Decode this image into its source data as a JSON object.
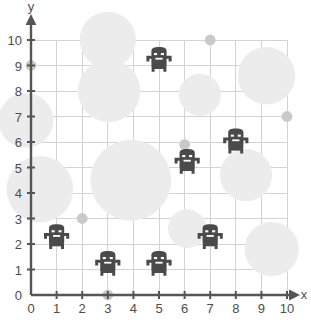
{
  "chart_data": {
    "type": "scatter",
    "title": "",
    "xlabel": "x",
    "ylabel": "y",
    "xlim": [
      0,
      10
    ],
    "ylim": [
      0,
      10
    ],
    "xticks": [
      "0",
      "1",
      "2",
      "3",
      "4",
      "5",
      "6",
      "7",
      "8",
      "9",
      "10"
    ],
    "yticks": [
      "0",
      "1",
      "2",
      "3",
      "4",
      "5",
      "6",
      "7",
      "8",
      "9",
      "10"
    ],
    "grid": true,
    "legend": "none",
    "colors": {
      "background": "#ffffff",
      "grid_line": "#d0d0d0",
      "axis_line": "#555555",
      "tick_text": "#4d4d4d",
      "bubble_fill": "#ececec",
      "dot_fill": "#c9c9c9",
      "robot_fill": "#4a4a4a"
    },
    "series": [
      {
        "name": "robots",
        "marker": "robot-icon",
        "points": [
          {
            "x": 5.0,
            "y": 9.2
          },
          {
            "x": 8.0,
            "y": 6.0
          },
          {
            "x": 6.1,
            "y": 5.2
          },
          {
            "x": 1.0,
            "y": 2.25
          },
          {
            "x": 7.0,
            "y": 2.25
          },
          {
            "x": 3.0,
            "y": 1.2
          },
          {
            "x": 5.0,
            "y": 1.2
          }
        ]
      },
      {
        "name": "large-bubbles",
        "marker": "circle",
        "points": [
          {
            "x": 3.0,
            "y": 10.0,
            "r": 1.1
          },
          {
            "x": 3.05,
            "y": 8.0,
            "r": 1.22
          },
          {
            "x": -0.2,
            "y": 6.85,
            "r": 1.07
          },
          {
            "x": 0.35,
            "y": 4.15,
            "r": 1.3
          },
          {
            "x": 3.9,
            "y": 4.5,
            "r": 1.58
          },
          {
            "x": 6.6,
            "y": 7.85,
            "r": 0.82
          },
          {
            "x": 9.2,
            "y": 8.6,
            "r": 1.12
          },
          {
            "x": 8.4,
            "y": 4.7,
            "r": 1.02
          },
          {
            "x": 9.4,
            "y": 1.8,
            "r": 1.06
          },
          {
            "x": 6.1,
            "y": 2.6,
            "r": 0.75
          }
        ]
      },
      {
        "name": "small-dots",
        "marker": "dot",
        "points": [
          {
            "x": 0.0,
            "y": 9.0
          },
          {
            "x": 7.0,
            "y": 10.0
          },
          {
            "x": 10.0,
            "y": 7.0
          },
          {
            "x": 6.0,
            "y": 5.9
          },
          {
            "x": 2.0,
            "y": 3.0
          },
          {
            "x": 3.0,
            "y": 0.0
          }
        ]
      }
    ]
  }
}
